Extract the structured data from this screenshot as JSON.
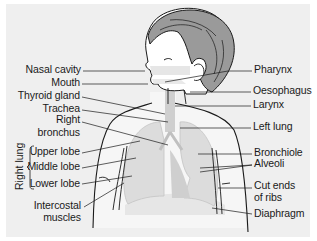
{
  "diagram": {
    "colors": {
      "panel_background": "#efefef",
      "page_background": "#ffffff",
      "hair": "#9a9a9a",
      "outline": "#1a1a1a",
      "lungs": "#dcdcdc",
      "airway": "#c8c8c8"
    },
    "labels_left": {
      "nasal_cavity": "Nasal cavity",
      "mouth": "Mouth",
      "thyroid_gland": "Thyroid gland",
      "trachea": "Trachea",
      "right_bronchus_line1": "Right",
      "right_bronchus_line2": "bronchus",
      "upper_lobe": "Upper lobe",
      "middle_lobe": "Middle lobe",
      "lower_lobe": "Lower lobe",
      "intercostal_line1": "Intercostal",
      "intercostal_line2": "muscles"
    },
    "group_label": {
      "right_lung": "Right lung"
    },
    "labels_right": {
      "pharynx": "Pharynx",
      "oesophagus": "Oesophagus",
      "larynx": "Larynx",
      "left_lung": "Left lung",
      "bronchiole": "Bronchiole",
      "alveoli": "Alveoli",
      "cut_ends_line1": "Cut ends",
      "cut_ends_line2": "of ribs",
      "diaphragm": "Diaphragm"
    }
  }
}
